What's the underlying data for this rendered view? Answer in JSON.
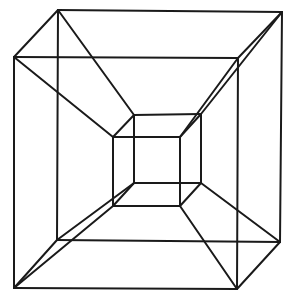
{
  "diagram": {
    "stroke_color": "#1a1a1a",
    "background_color": "#ffffff",
    "stroke_width": 2,
    "vertices": {
      "OBTL": [
        58,
        10
      ],
      "OBTR": [
        282,
        12
      ],
      "OBBL": [
        57,
        240
      ],
      "OBBR": [
        280,
        242
      ],
      "OFTL": [
        14,
        57
      ],
      "OFTR": [
        238,
        58
      ],
      "OFBL": [
        14,
        288
      ],
      "OFBR": [
        237,
        289
      ],
      "IBTL": [
        134,
        115
      ],
      "IBTR": [
        201,
        114
      ],
      "IBBL": [
        134,
        183
      ],
      "IBBR": [
        201,
        183
      ],
      "IFTL": [
        113,
        137
      ],
      "IFTR": [
        180,
        137
      ],
      "IFBL": [
        113,
        206
      ],
      "IFBR": [
        180,
        206
      ]
    },
    "edges": [
      [
        "OBTL",
        "OBTR"
      ],
      [
        "OBTR",
        "OBBR"
      ],
      [
        "OBBR",
        "OBBL"
      ],
      [
        "OBBL",
        "OBTL"
      ],
      [
        "OFTL",
        "OFTR"
      ],
      [
        "OFTR",
        "OFBR"
      ],
      [
        "OFBR",
        "OFBL"
      ],
      [
        "OFBL",
        "OFTL"
      ],
      [
        "OBTL",
        "OFTL"
      ],
      [
        "OBTR",
        "OFTR"
      ],
      [
        "OBBL",
        "OFBL"
      ],
      [
        "OBBR",
        "OFBR"
      ],
      [
        "IBTL",
        "IBTR"
      ],
      [
        "IBTR",
        "IBBR"
      ],
      [
        "IBBR",
        "IBBL"
      ],
      [
        "IBBL",
        "IBTL"
      ],
      [
        "IFTL",
        "IFTR"
      ],
      [
        "IFTR",
        "IFBR"
      ],
      [
        "IFBR",
        "IFBL"
      ],
      [
        "IFBL",
        "IFTL"
      ],
      [
        "IBTL",
        "IFTL"
      ],
      [
        "IBTR",
        "IFTR"
      ],
      [
        "IBBL",
        "IFBL"
      ],
      [
        "IBBR",
        "IFBR"
      ],
      [
        "OBTL",
        "IBTL"
      ],
      [
        "OBTR",
        "IBTR"
      ],
      [
        "OBBL",
        "IBBL"
      ],
      [
        "OBBR",
        "IBBR"
      ],
      [
        "OFTL",
        "IFTL"
      ],
      [
        "OFTR",
        "IFTR"
      ],
      [
        "OFBL",
        "IFBL"
      ],
      [
        "OFBR",
        "IFBR"
      ]
    ]
  }
}
